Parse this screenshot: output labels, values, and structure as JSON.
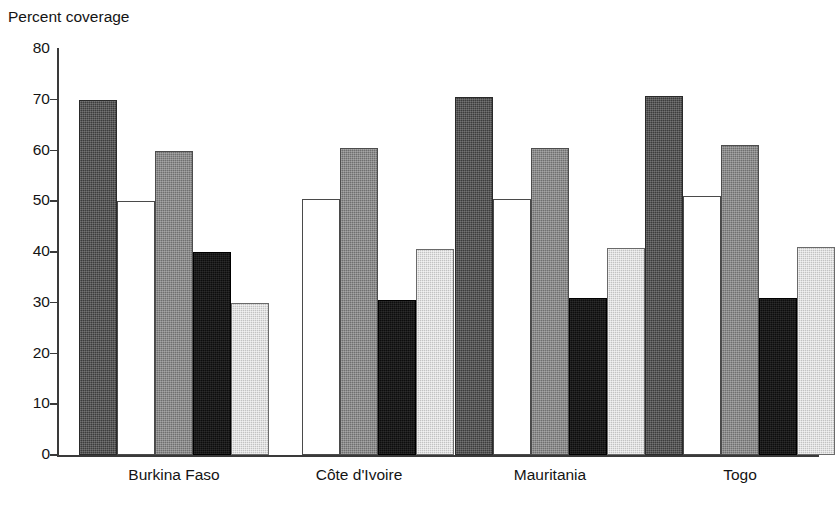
{
  "figure": {
    "clipped_title_remnant": "                              ",
    "axis_title": "Percent coverage"
  },
  "chart_data": {
    "type": "bar",
    "title": "Percent coverage",
    "xlabel": "",
    "ylabel": "Percent coverage",
    "ylim": [
      0,
      80
    ],
    "yticks": [
      0,
      10,
      20,
      30,
      40,
      50,
      60,
      70,
      80
    ],
    "ytick_labels": [
      "0",
      "10",
      "20",
      "30",
      "40",
      "50",
      "60",
      "70",
      "80"
    ],
    "grid": false,
    "legend": "none",
    "orientation": "vertical",
    "bar_style": "grouped-contiguous",
    "categories": [
      "Burkina Faso",
      "Côte d'Ivoire",
      "Mauritania",
      "Togo"
    ],
    "series": [
      {
        "name": "series-1",
        "fill": "dark-gray",
        "color": "#3c3c3c",
        "values": [
          70.0,
          null,
          70.5,
          70.8
        ]
      },
      {
        "name": "series-2",
        "fill": "white",
        "color": "#ffffff",
        "values": [
          50.0,
          50.5,
          50.5,
          51.0
        ]
      },
      {
        "name": "series-3",
        "fill": "medium-gray",
        "color": "#6f6f6f",
        "values": [
          60.0,
          60.5,
          60.5,
          61.0
        ]
      },
      {
        "name": "series-4",
        "fill": "black",
        "color": "#0d0d0d",
        "values": [
          40.0,
          30.5,
          31.0,
          31.0
        ]
      },
      {
        "name": "series-5",
        "fill": "light-gray",
        "color": "#c2c2c2",
        "values": [
          30.0,
          40.5,
          40.7,
          41.0
        ]
      }
    ]
  },
  "layout": {
    "plot_left": 57,
    "plot_top": 49,
    "plot_width": 762,
    "plot_height": 406,
    "bar_width": 38,
    "group_starts": [
      79,
      264,
      455,
      645
    ]
  }
}
